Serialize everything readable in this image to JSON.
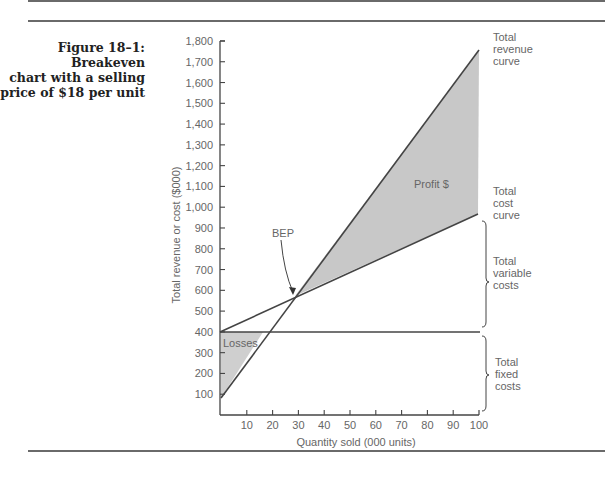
{
  "figure": {
    "caption_line1": "Figure 18–1: Breakeven",
    "caption_line2": "chart with a selling",
    "caption_line3": "price of $18 per unit"
  },
  "chart_data": {
    "type": "line",
    "title": "Breakeven chart with a selling price of $18 per unit",
    "xlabel": "Quantity sold (000 units)",
    "ylabel": "Total revenue or cost ($000)",
    "xlim": [
      0,
      100
    ],
    "ylim": [
      0,
      1800
    ],
    "x_ticks": [
      10,
      20,
      30,
      40,
      50,
      60,
      70,
      80,
      90,
      100
    ],
    "y_ticks": [
      "100",
      "200",
      "300",
      "400",
      "500",
      "600",
      "700",
      "800",
      "900",
      "1,000",
      "1,100",
      "1,200",
      "1,300",
      "1,400",
      "1,500",
      "1,600",
      "1,700",
      "1,800"
    ],
    "grid": false,
    "x": [
      0,
      10,
      20,
      30,
      40,
      50,
      60,
      70,
      80,
      90,
      100
    ],
    "series": [
      {
        "name": "Total revenue curve",
        "values": [
          80,
          248,
          416,
          584,
          752,
          920,
          1088,
          1256,
          1424,
          1592,
          1760
        ]
      },
      {
        "name": "Total cost curve",
        "values": [
          400,
          458,
          516,
          574,
          632,
          690,
          748,
          806,
          864,
          922,
          980
        ]
      },
      {
        "name": "Total fixed costs",
        "values": [
          400,
          400,
          400,
          400,
          400,
          400,
          400,
          400,
          400,
          400,
          400
        ]
      }
    ],
    "annotations": [
      {
        "text": "BEP",
        "x": 30,
        "y": 575
      },
      {
        "text": "Profit $",
        "region": "between revenue and cost, x > 30"
      },
      {
        "text": "Losses",
        "region": "between cost and revenue, x < 30"
      },
      {
        "text": "Total revenue curve"
      },
      {
        "text": "Total cost curve"
      },
      {
        "text": "Total variable costs",
        "bracket": [
          400,
          980
        ]
      },
      {
        "text": "Total fixed costs",
        "bracket": [
          0,
          400
        ]
      }
    ]
  },
  "labels": {
    "bep": "BEP",
    "profit": "Profit $",
    "losses": "Losses",
    "revenue": [
      "Total",
      "revenue",
      "curve"
    ],
    "cost": [
      "Total",
      "cost",
      "curve"
    ],
    "variable": [
      "Total",
      "variable",
      "costs"
    ],
    "fixed": [
      "Total",
      "fixed",
      "costs"
    ]
  }
}
